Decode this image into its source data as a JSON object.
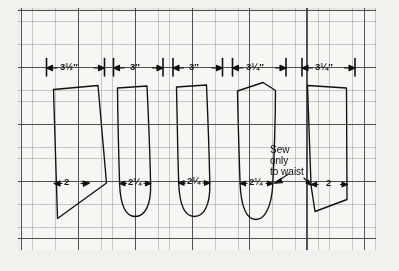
{
  "figure": {
    "type": "sewing-pattern-layout",
    "medium": "graph-paper",
    "background_color": "#f2f1ee",
    "paper_color": "#f7f6f2",
    "ink_color": "#111111",
    "grid": {
      "fine_color": "#787d87",
      "bold_color": "#373a42",
      "bold_every": 5
    }
  },
  "top_measurements": [
    {
      "id": "piece-1-width",
      "value": "3½″"
    },
    {
      "id": "piece-2-width",
      "value": "3″"
    },
    {
      "id": "piece-3-width",
      "value": "3″"
    },
    {
      "id": "piece-4-width",
      "value": "3¼″"
    },
    {
      "id": "piece-5-width",
      "value": "3¼″"
    }
  ],
  "bottom_measurements": [
    {
      "id": "piece-1-bottom",
      "value": "2"
    },
    {
      "id": "piece-2-bottom",
      "value": "2¼"
    },
    {
      "id": "piece-3-bottom",
      "value": "2¼"
    },
    {
      "id": "piece-4-bottom",
      "value": "2¼"
    },
    {
      "id": "piece-5-bottom",
      "value": "2"
    }
  ],
  "annotations": [
    {
      "id": "sew-note",
      "lines": [
        "Sew",
        "only",
        "to waist"
      ]
    }
  ],
  "pieces": [
    {
      "id": "piece-1",
      "shape": "tapered-point",
      "bottom": "pointed"
    },
    {
      "id": "piece-2",
      "shape": "tapered-gore",
      "bottom": "rounded"
    },
    {
      "id": "piece-3",
      "shape": "tapered-gore",
      "bottom": "rounded"
    },
    {
      "id": "piece-4",
      "shape": "peaked-gore",
      "bottom": "rounded"
    },
    {
      "id": "piece-5",
      "shape": "angled-panel",
      "bottom": "angled"
    }
  ]
}
